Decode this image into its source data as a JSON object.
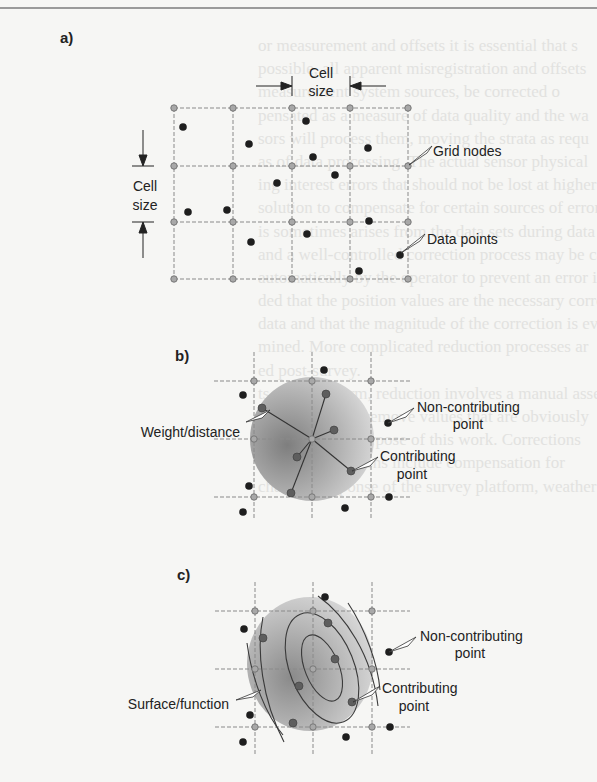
{
  "figure": {
    "panels": [
      {
        "id": "a",
        "label": "a)",
        "annotations": {
          "cell_size_horizontal": [
            "Cell",
            "size"
          ],
          "cell_size_vertical": [
            "Cell",
            "size"
          ],
          "grid_nodes": "Grid nodes",
          "data_points": "Data points"
        }
      },
      {
        "id": "b",
        "label": "b)",
        "annotations": {
          "weight_distance": "Weight/distance",
          "non_contributing": [
            "Non-contributing",
            "point"
          ],
          "contributing": [
            "Contributing",
            "point"
          ]
        }
      },
      {
        "id": "c",
        "label": "c)",
        "annotations": {
          "surface_function": "Surface/function",
          "non_contributing": [
            "Non-contributing",
            "point"
          ],
          "contributing": [
            "Contributing",
            "point"
          ]
        }
      }
    ],
    "colors": {
      "grid_line": "#8a8a8a",
      "grid_node_fill": "#a8a8a8",
      "data_point": "#1e1e1e",
      "contributing_point": "#5e5e5e",
      "search_disk_dark": "#8c8c8c",
      "search_disk_light": "#dcdcdc",
      "text": "#222222"
    }
  },
  "bleed_through_text": [
    "or measurement and offsets it is essential that s",
    "possible, all apparent misregistration and offsets",
    "measurement system sources, be corrected o",
    "pensated as a measure of data quality and the wa",
    "sors will process them, moving the strata as requ",
    "as of data processing. The actual sensor physical",
    "ing interest errors that should not be lost at higher",
    "solution to compensate for certain sources of error",
    "is sometimes arises from the data sets during data",
    "and a well-controlled correction process may be carried",
    "automatically by the operator to prevent an error in",
    "ded that the position values are the necessary correct",
    "data and that the magnitude of the correction is eval",
    "mined. More complicated reduction processes ar",
    "ed post-survey.",
    "ts simplest form, reduction involves a manual assess",
    "g of the data to remove values that are obviously",
    "blistic for the purpose of this work. Corrections",
    "applied corrections include compensation for",
    "chanical response of the survey platform, weather"
  ]
}
